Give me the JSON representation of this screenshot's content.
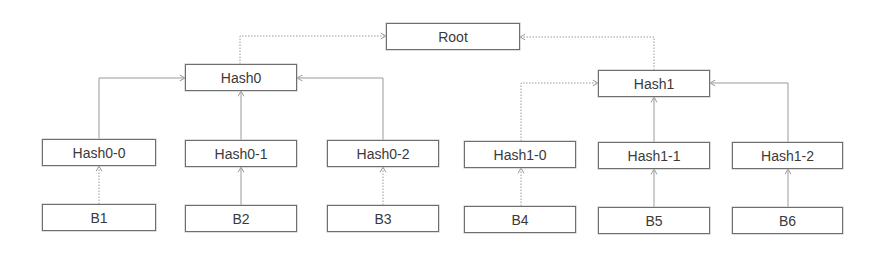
{
  "diagram": {
    "type": "merkle-tree",
    "line_color": "#9a9a9a",
    "nodes": {
      "root": {
        "label": "Root",
        "x": 386,
        "y": 23,
        "w": 134,
        "h": 27
      },
      "hash0": {
        "label": "Hash0",
        "x": 185,
        "y": 64,
        "w": 112,
        "h": 27
      },
      "hash1": {
        "label": "Hash1",
        "x": 598,
        "y": 70,
        "w": 112,
        "h": 27
      },
      "hash0_0": {
        "label": "Hash0-0",
        "x": 42,
        "y": 139,
        "w": 114,
        "h": 27
      },
      "hash0_1": {
        "label": "Hash0-1",
        "x": 185,
        "y": 140,
        "w": 112,
        "h": 27
      },
      "hash0_2": {
        "label": "Hash0-2",
        "x": 327,
        "y": 140,
        "w": 112,
        "h": 27
      },
      "hash1_0": {
        "label": "Hash1-0",
        "x": 464,
        "y": 141,
        "w": 112,
        "h": 27
      },
      "hash1_1": {
        "label": "Hash1-1",
        "x": 598,
        "y": 142,
        "w": 112,
        "h": 27
      },
      "hash1_2": {
        "label": "Hash1-2",
        "x": 732,
        "y": 142,
        "w": 111,
        "h": 27
      },
      "b1": {
        "label": "B1",
        "x": 42,
        "y": 204,
        "w": 114,
        "h": 27
      },
      "b2": {
        "label": "B2",
        "x": 185,
        "y": 205,
        "w": 112,
        "h": 27
      },
      "b3": {
        "label": "B3",
        "x": 327,
        "y": 205,
        "w": 112,
        "h": 27
      },
      "b4": {
        "label": "B4",
        "x": 464,
        "y": 206,
        "w": 112,
        "h": 27
      },
      "b5": {
        "label": "B5",
        "x": 598,
        "y": 207,
        "w": 112,
        "h": 27
      },
      "b6": {
        "label": "B6",
        "x": 732,
        "y": 207,
        "w": 111,
        "h": 27
      }
    },
    "edges": [
      {
        "from": "hash0",
        "to": "root",
        "points": [
          [
            240,
            64
          ],
          [
            240,
            36
          ],
          [
            386,
            36
          ]
        ],
        "dotted": true
      },
      {
        "from": "hash1",
        "to": "root",
        "points": [
          [
            654,
            70
          ],
          [
            654,
            37
          ],
          [
            520,
            37
          ]
        ],
        "dotted": true
      },
      {
        "from": "hash0_0",
        "to": "hash0",
        "points": [
          [
            99,
            139
          ],
          [
            99,
            78
          ],
          [
            185,
            78
          ]
        ],
        "dotted": false
      },
      {
        "from": "hash0_1",
        "to": "hash0",
        "points": [
          [
            241,
            140
          ],
          [
            241,
            91
          ]
        ],
        "dotted": false
      },
      {
        "from": "hash0_2",
        "to": "hash0",
        "points": [
          [
            383,
            140
          ],
          [
            383,
            78
          ],
          [
            297,
            78
          ]
        ],
        "dotted": false
      },
      {
        "from": "hash1_0",
        "to": "hash1",
        "points": [
          [
            521,
            141
          ],
          [
            521,
            83
          ],
          [
            598,
            83
          ]
        ],
        "dotted": true
      },
      {
        "from": "hash1_1",
        "to": "hash1",
        "points": [
          [
            654,
            142
          ],
          [
            654,
            97
          ]
        ],
        "dotted": false
      },
      {
        "from": "hash1_2",
        "to": "hash1",
        "points": [
          [
            788,
            142
          ],
          [
            788,
            83
          ],
          [
            710,
            83
          ]
        ],
        "dotted": false
      },
      {
        "from": "b1",
        "to": "hash0_0",
        "points": [
          [
            99,
            204
          ],
          [
            99,
            166
          ]
        ],
        "dotted": true
      },
      {
        "from": "b2",
        "to": "hash0_1",
        "points": [
          [
            241,
            205
          ],
          [
            241,
            167
          ]
        ],
        "dotted": false
      },
      {
        "from": "b3",
        "to": "hash0_2",
        "points": [
          [
            383,
            205
          ],
          [
            383,
            167
          ]
        ],
        "dotted": true
      },
      {
        "from": "b4",
        "to": "hash1_0",
        "points": [
          [
            521,
            206
          ],
          [
            521,
            168
          ]
        ],
        "dotted": true
      },
      {
        "from": "b5",
        "to": "hash1_1",
        "points": [
          [
            654,
            207
          ],
          [
            654,
            169
          ]
        ],
        "dotted": false
      },
      {
        "from": "b6",
        "to": "hash1_2",
        "points": [
          [
            788,
            207
          ],
          [
            788,
            169
          ]
        ],
        "dotted": false
      }
    ]
  }
}
